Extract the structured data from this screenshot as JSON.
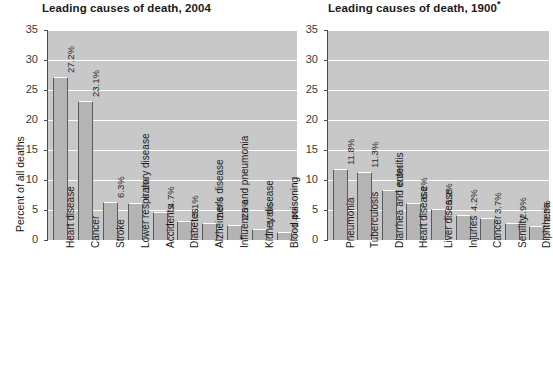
{
  "chart_data": [
    {
      "type": "bar",
      "title": "Leading causes of death, 2004",
      "title_suffix": "",
      "xlabel": "",
      "ylabel": "Percent of all deaths",
      "ylim": [
        0,
        35
      ],
      "yticks": [
        0,
        5,
        10,
        15,
        20,
        25,
        30,
        35
      ],
      "ytick_labels": [
        "0",
        "5",
        "10",
        "15",
        "20",
        "25",
        "30",
        "35"
      ],
      "grid": true,
      "legend": "none",
      "categories": [
        "Heart disease",
        "Cancer",
        "Stroke",
        "Lower respiratory disease",
        "Accidents",
        "Diabetes",
        "Alzheimer's disease",
        "Influenza and pneumonia",
        "Kidney disease",
        "Blood poisoning"
      ],
      "values": [
        27.2,
        23.1,
        6.3,
        6.1,
        4.7,
        3.1,
        2.8,
        2.5,
        1.8,
        1.4
      ],
      "value_labels": [
        "27.2%",
        "23.1%",
        "6.3%",
        "6.1%",
        "4.7%",
        "3.1%",
        "2.8%",
        "2.5%",
        "1.8%",
        "1.4%"
      ]
    },
    {
      "type": "bar",
      "title": "Leading causes of death, 1900",
      "title_suffix": "*",
      "xlabel": "",
      "ylabel": "",
      "ylim": [
        0,
        35
      ],
      "yticks": [
        0,
        5,
        10,
        15,
        20,
        25,
        30,
        35
      ],
      "ytick_labels": [
        "0",
        "5",
        "10",
        "15",
        "20",
        "25",
        "30",
        "35"
      ],
      "grid": true,
      "legend": "none",
      "categories": [
        "Pneumonia",
        "Tuberculosis",
        "Diarrhea and enteritis",
        "Heart disease",
        "Liver disease",
        "Injuries",
        "Cancer",
        "Senility",
        "Diphtheria"
      ],
      "values": [
        11.8,
        11.3,
        8.3,
        6.2,
        5.2,
        4.2,
        3.7,
        2.9,
        2.3
      ],
      "value_labels": [
        "11.8%",
        "11.3%",
        "8.3%",
        "6.2%",
        "5.2%",
        "4.2%",
        "3.7%",
        "2.9%",
        "2.3%"
      ]
    }
  ],
  "colors": {
    "plot_background": "#c8c8c8",
    "bar_fill": "#b4b4b4",
    "bar_edge": "#5a5a5a",
    "gridline": "#ffffff",
    "text": "#1a1a1a",
    "page_background": "#ffffff"
  }
}
